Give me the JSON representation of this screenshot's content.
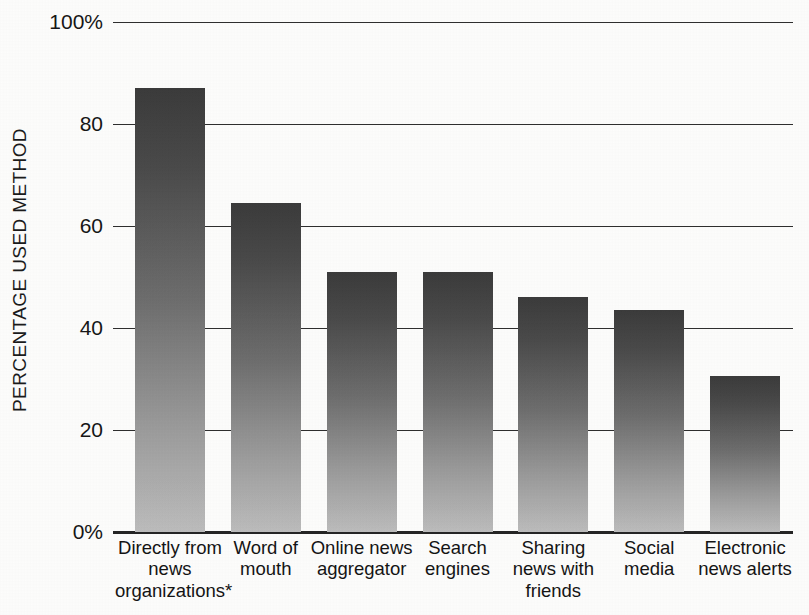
{
  "chart_data": {
    "type": "bar",
    "title": "",
    "subtitle": "",
    "xlabel": "",
    "ylabel": "PERCENTAGE USED METHOD",
    "ylim": [
      0,
      100
    ],
    "grid": true,
    "legend": "none",
    "ytick_labels": [
      "100%",
      "80",
      "60",
      "40",
      "20",
      "0%"
    ],
    "ytick_values": [
      100,
      80,
      60,
      40,
      20,
      0
    ],
    "categories": [
      "Directly from news organizations*",
      "Word of mouth",
      "Online news aggregator",
      "Search engines",
      "Sharing news with friends",
      "Social media",
      "Electronic news alerts"
    ],
    "category_lines": [
      [
        "Directly from",
        "news",
        "organizations*"
      ],
      [
        "Word of",
        "mouth"
      ],
      [
        "Online news",
        "aggregator"
      ],
      [
        "Search",
        "engines"
      ],
      [
        "Sharing",
        "news with",
        "friends"
      ],
      [
        "Social",
        "media"
      ],
      [
        "Electronic",
        "news alerts"
      ]
    ],
    "values": [
      87,
      64.5,
      51,
      51,
      46,
      43.5,
      30.5
    ],
    "annotations": [
      "*"
    ],
    "colors": {
      "bar_top": "#3b3b3b",
      "bar_bottom": "#bdbdbd",
      "gridline": "#2e2e2e",
      "axis": "#252525",
      "text": "#141414",
      "background": "#fdfdfc"
    }
  }
}
